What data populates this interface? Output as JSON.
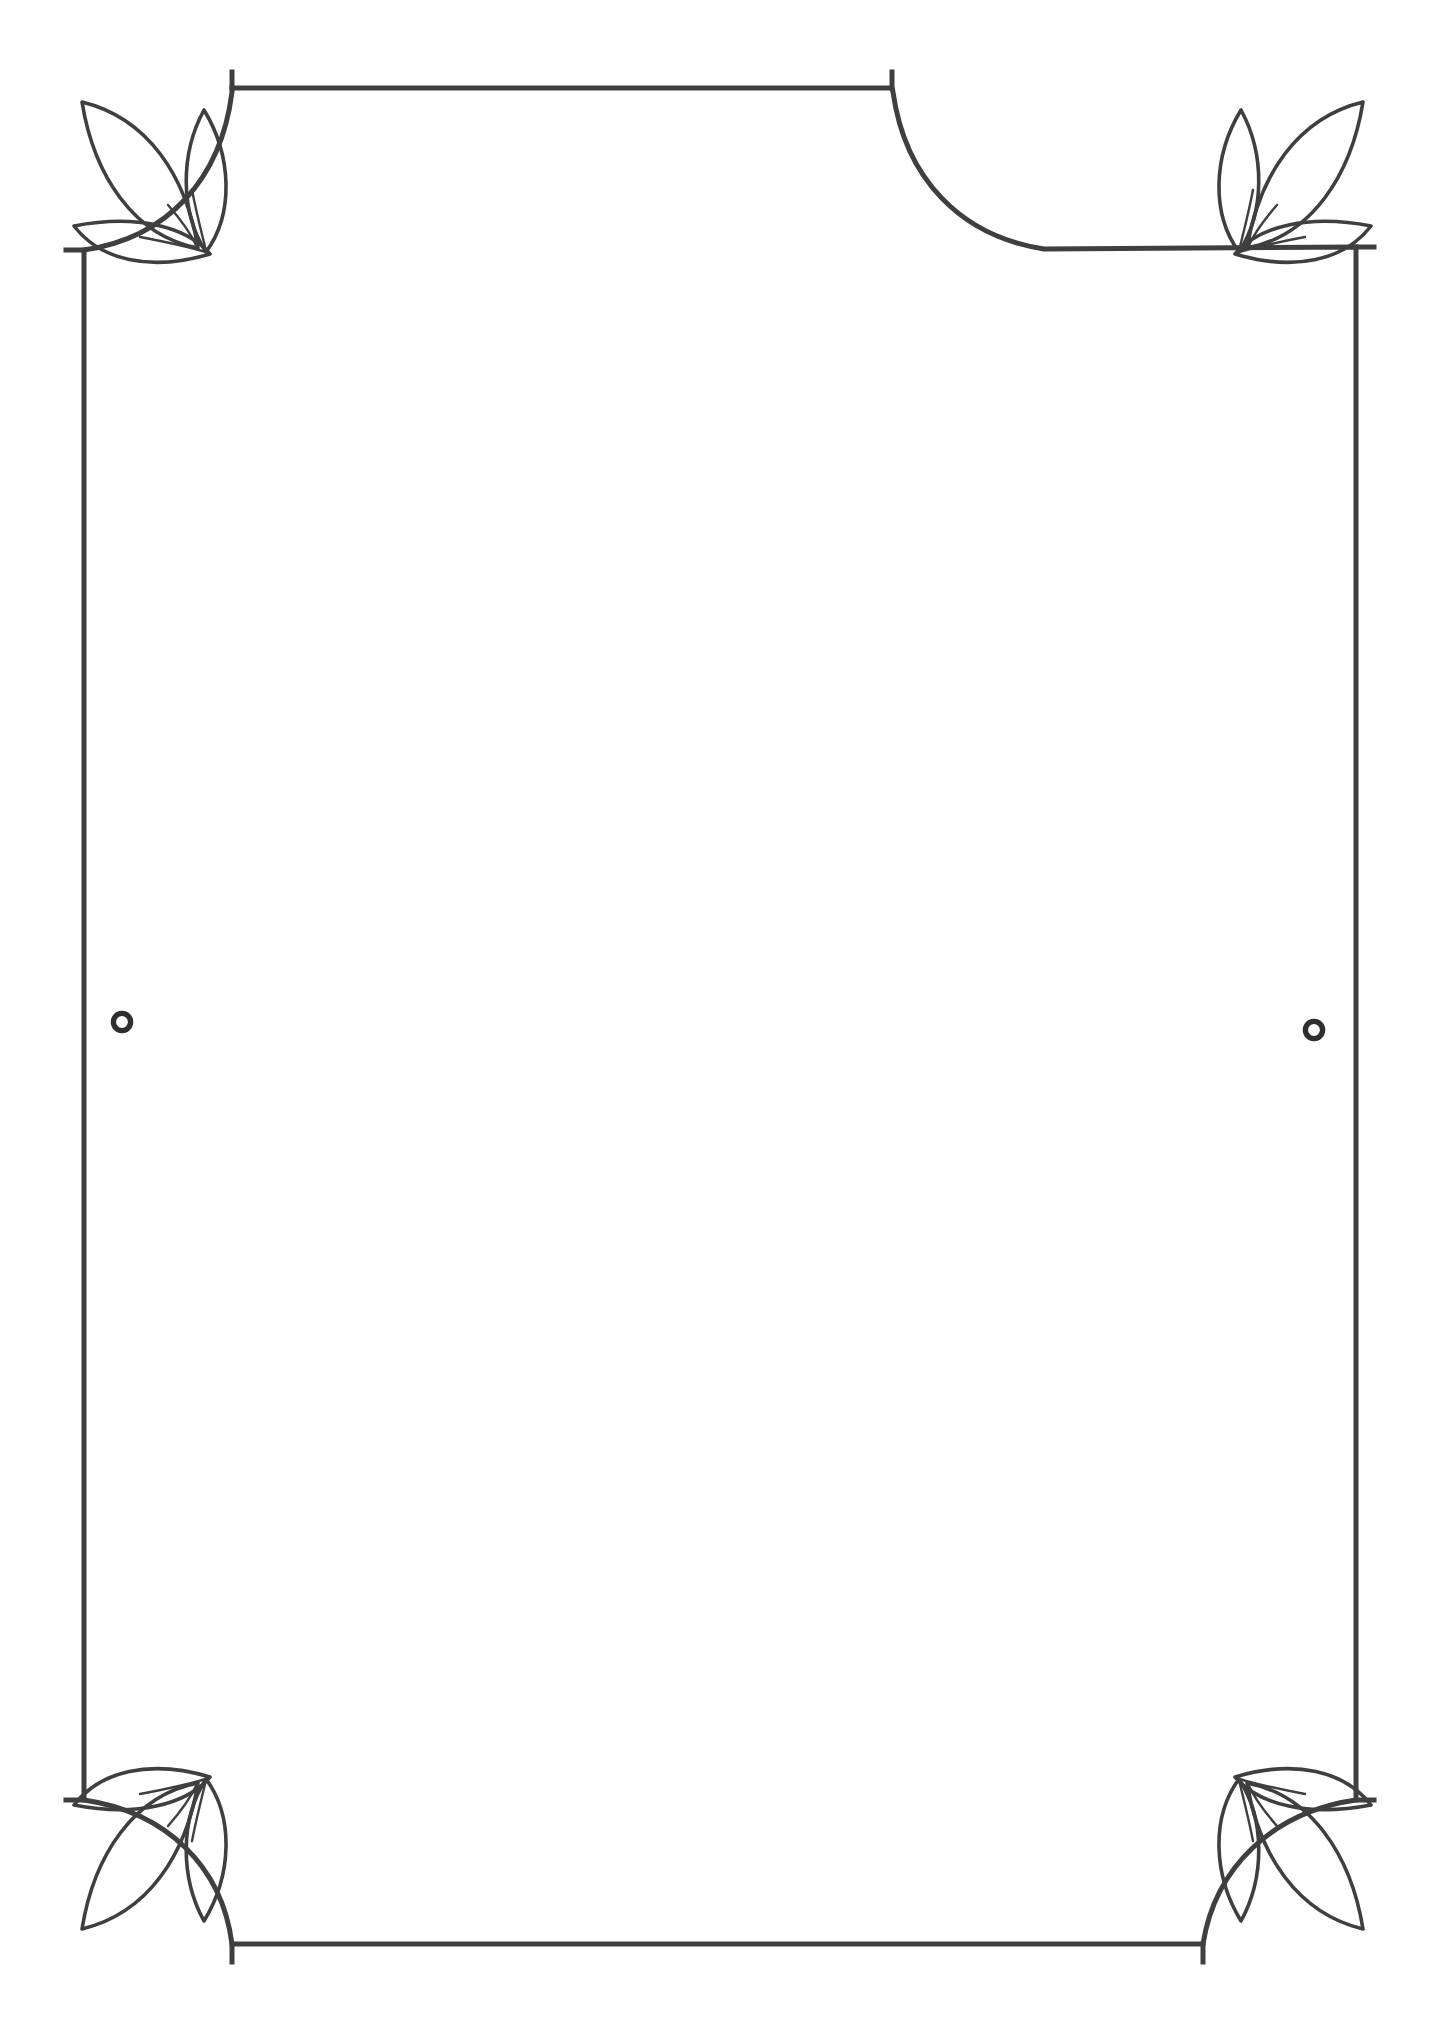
{
  "document": {
    "kind": "decorative-border-frame",
    "title": "",
    "body_text": "",
    "page_width": 1445,
    "page_height": 2031,
    "background_color": "#ffffff",
    "ink_color": "#3f3f3f",
    "hairline_color": "#8a8a8a",
    "orientation": "portrait",
    "interior_text": ""
  },
  "frame": {
    "outer": {
      "left": 84,
      "top": 107,
      "right": 1356,
      "bottom": 1945,
      "stroke_width": 5,
      "corner_style": "concave-arc",
      "corner_radius": 148,
      "notch": 22
    },
    "inner_rule": {
      "left_x": 122,
      "right_x": 1314,
      "top_y": 336,
      "bottom_y": 1716,
      "stroke_width": 1.4,
      "style": "tapered-hairline"
    }
  },
  "ornaments": {
    "corner_motif_name": "three-leaf-sprig",
    "leaf_count_per_corner": 3,
    "corners": [
      {
        "id": "top-left",
        "label": "Top Left Leaf Sprig",
        "flip_x": false,
        "flip_y": false
      },
      {
        "id": "top-right",
        "label": "Top Right Leaf Sprig",
        "flip_x": true,
        "flip_y": false
      },
      {
        "id": "bottom-left",
        "label": "Bottom Left Leaf Sprig",
        "flip_x": false,
        "flip_y": true
      },
      {
        "id": "bottom-right",
        "label": "Bottom Right Leaf Sprig",
        "flip_x": true,
        "flip_y": true
      }
    ],
    "leaf_stroke_width": 3.6,
    "side_medallions": [
      {
        "id": "left-ring",
        "label": "Left Side Ring",
        "cx": 122,
        "cy": 1022,
        "outer_r": 11.5,
        "inner_r": 6.0
      },
      {
        "id": "right-ring",
        "label": "Right Side Ring",
        "cx": 1314,
        "cy": 1030,
        "outer_r": 11.5,
        "inner_r": 6.0
      }
    ]
  }
}
